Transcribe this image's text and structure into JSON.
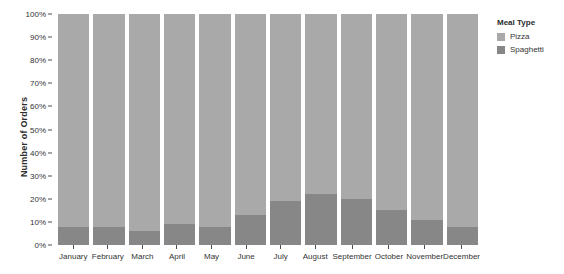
{
  "chart_data": {
    "type": "bar",
    "stacked": true,
    "normalized_percent": true,
    "title": "",
    "subtitle": "",
    "xlabel": "",
    "ylabel": "Number of Orders",
    "ylim": [
      0,
      100
    ],
    "y_tick_labels": [
      "100%",
      "90%",
      "80%",
      "70%",
      "60%",
      "50%",
      "40%",
      "30%",
      "20%",
      "10%",
      "0%"
    ],
    "y_tick_values": [
      100,
      90,
      80,
      70,
      60,
      50,
      40,
      30,
      20,
      10,
      0
    ],
    "grid": false,
    "legend_position": "right",
    "legend_title": "Meal Type",
    "categories": [
      "January",
      "February",
      "March",
      "April",
      "May",
      "June",
      "July",
      "August",
      "September",
      "October",
      "November",
      "December"
    ],
    "series": [
      {
        "name": "Pizza",
        "color": "#a9a9a9",
        "values": [
          92,
          92,
          94,
          91,
          92,
          87,
          81,
          78,
          80,
          85,
          89,
          92
        ]
      },
      {
        "name": "Spaghetti",
        "color": "#878787",
        "values": [
          8,
          8,
          6,
          9,
          8,
          13,
          19,
          22,
          20,
          15,
          11,
          8
        ]
      }
    ]
  },
  "colors": {
    "background": "#ffffff",
    "axis": "#4d4d4d",
    "text": "#333333",
    "pizza": "#a9a9a9",
    "spaghetti": "#878787"
  }
}
